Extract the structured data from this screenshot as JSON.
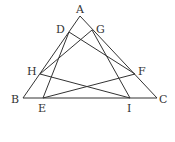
{
  "figure": {
    "stroke_color": "#333333",
    "background_color": "#ffffff",
    "points": [
      {
        "id": "A",
        "label": "A"
      },
      {
        "id": "B",
        "label": "B"
      },
      {
        "id": "C",
        "label": "C"
      },
      {
        "id": "D",
        "label": "D"
      },
      {
        "id": "G",
        "label": "G"
      },
      {
        "id": "H",
        "label": "H"
      },
      {
        "id": "F",
        "label": "F"
      },
      {
        "id": "E",
        "label": "E"
      },
      {
        "id": "I",
        "label": "I"
      }
    ],
    "segments": [
      [
        "A",
        "B"
      ],
      [
        "B",
        "C"
      ],
      [
        "C",
        "A"
      ],
      [
        "D",
        "E"
      ],
      [
        "D",
        "F"
      ],
      [
        "G",
        "H"
      ],
      [
        "G",
        "I"
      ],
      [
        "H",
        "I"
      ],
      [
        "E",
        "F"
      ]
    ],
    "relations": {
      "D_on": "AB",
      "H_on": "AB",
      "G_on": "AC",
      "F_on": "AC",
      "E_on": "BC",
      "I_on": "BC"
    }
  }
}
